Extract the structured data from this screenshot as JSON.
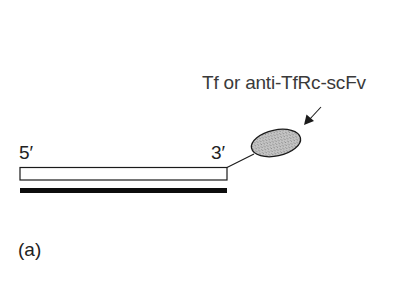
{
  "figure": {
    "panel_label": "(a)",
    "ligand_label": "Tf or anti-TfRc-scFv",
    "strand_end_5": "5′",
    "strand_end_3": "3′"
  },
  "colors": {
    "background": "#ffffff",
    "stroke": "#1a1a1a",
    "ligand_fill": "#b9b9b9",
    "complementary_strand": "#0d0d0d",
    "text": "#222222"
  }
}
